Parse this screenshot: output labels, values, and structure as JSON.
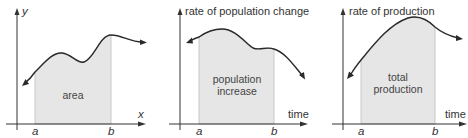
{
  "colors": {
    "axis": "#333333",
    "curve": "#2a2a2a",
    "shade": "#e6e6e6",
    "shade_edge": "#bdbdbd",
    "text": "#333333"
  },
  "panels": [
    {
      "y_label": "y",
      "x_label": "x",
      "a_label": "a",
      "b_label": "b",
      "inside_lines": [
        "area"
      ]
    },
    {
      "y_label": "rate of population change",
      "x_label": "time",
      "a_label": "a",
      "b_label": "b",
      "inside_lines": [
        "population",
        "increase"
      ]
    },
    {
      "y_label": "rate of production",
      "x_label": "time",
      "a_label": "a",
      "b_label": "b",
      "inside_lines": [
        "total",
        "production"
      ]
    }
  ]
}
